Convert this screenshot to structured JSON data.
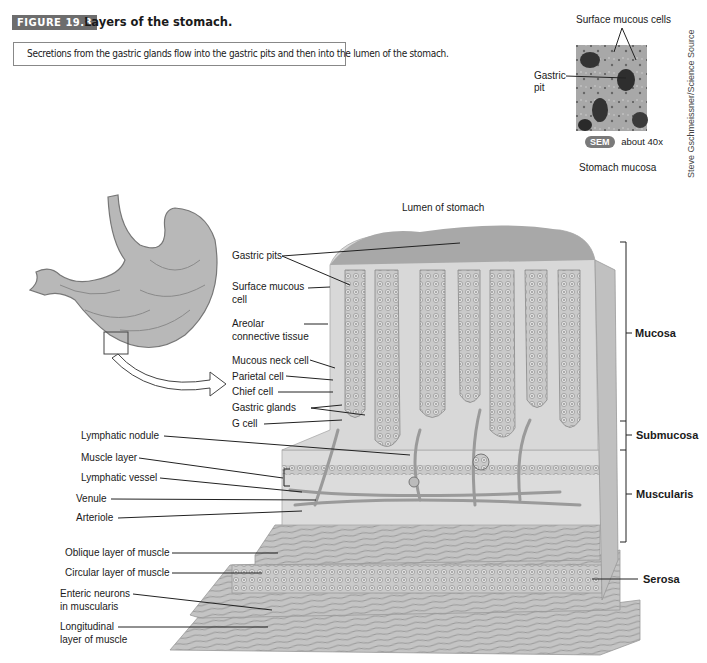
{
  "figure": {
    "badge": "FIGURE 19.8",
    "title": "Layers of the stomach.",
    "description": "Secretions from the gastric glands flow into the gastric pits and then into the lumen of the stomach."
  },
  "inset": {
    "label_surface_mucous_cells": "Surface mucous cells",
    "label_gastric_pit_line1": "Gastric",
    "label_gastric_pit_line2": "pit",
    "sem_badge": "SEM",
    "magnification": "about 40x",
    "caption": "Stomach mucosa",
    "credit": "Steve Gschmeissner/Science Source"
  },
  "main_diagram": {
    "lumen_label": "Lumen of stomach",
    "left_labels": [
      {
        "line1": "Gastric pits"
      },
      {
        "line1": "Surface mucous",
        "line2": "cell"
      },
      {
        "line1": "Areolar",
        "line2": "connective tissue"
      },
      {
        "line1": "Mucous neck cell"
      },
      {
        "line1": "Parietal cell"
      },
      {
        "line1": "Chief cell"
      },
      {
        "line1": "Gastric glands"
      },
      {
        "line1": "G cell"
      },
      {
        "line1": "Lymphatic nodule"
      },
      {
        "line1": "Muscle layer"
      },
      {
        "line1": "Lymphatic vessel"
      },
      {
        "line1": "Venule"
      },
      {
        "line1": "Arteriole"
      },
      {
        "line1": "Oblique layer of muscle"
      },
      {
        "line1": "Circular layer of muscle"
      },
      {
        "line1": "Enteric neurons",
        "line2": "in muscularis"
      },
      {
        "line1": "Longitudinal",
        "line2": "layer of muscle"
      }
    ],
    "right_labels": [
      "Mucosa",
      "Submucosa",
      "Muscularis",
      "Serosa"
    ]
  },
  "colors": {
    "badge_bg": "#6d6d6d",
    "tissue_gray": "#bdbdbd",
    "line": "#222222"
  }
}
